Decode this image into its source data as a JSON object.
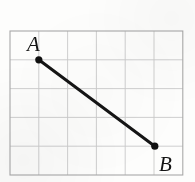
{
  "figure": {
    "kind": "geometry-diagram",
    "background_color": "#fdfdfc"
  },
  "grid": {
    "columns": 6,
    "rows": 5,
    "cell_size": 28.8,
    "origin_x": 10,
    "origin_y": 31,
    "width": 172.8,
    "height": 144,
    "line_color": "#c9c9c9",
    "frame_color": "#a8a8a8",
    "line_width": 0.9,
    "frame_width": 1.1
  },
  "points": [
    {
      "id": "A",
      "label": "A",
      "x": 38.8,
      "y": 59.8,
      "grid_col": 1,
      "grid_row": 1,
      "radius": 3.6,
      "color": "#101010",
      "label_x": 27,
      "label_y": 51,
      "label_size": 21
    },
    {
      "id": "B",
      "label": "B",
      "x": 154.8,
      "y": 146.2,
      "grid_col": 5,
      "grid_row": 4,
      "radius": 3.6,
      "color": "#101010",
      "label_x": 159,
      "label_y": 171,
      "label_size": 21
    }
  ],
  "segment": {
    "name": "AB",
    "from": "A",
    "to": "B",
    "x1": 38.8,
    "y1": 59.8,
    "x2": 154.8,
    "y2": 146.2,
    "color": "#151515",
    "width": 3.0
  }
}
